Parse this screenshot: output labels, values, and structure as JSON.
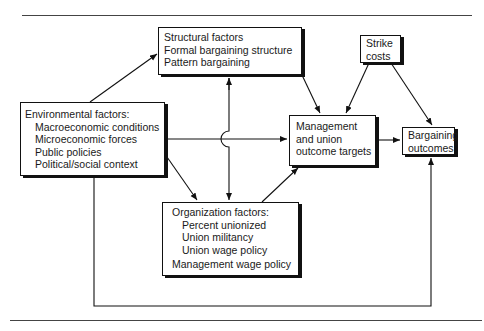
{
  "diagram": {
    "nodes": {
      "structural": {
        "lines": [
          "Structural factors",
          "Formal bargaining structure",
          "Pattern bargaining"
        ]
      },
      "strike": {
        "lines": [
          "Strike",
          "costs"
        ]
      },
      "environmental": {
        "title": "Environmental factors:",
        "items": [
          "Macroeconomic conditions",
          "Microeconomic forces",
          "Public policies",
          "Political/social context"
        ]
      },
      "targets": {
        "lines": [
          "Management",
          "and union",
          "outcome targets"
        ]
      },
      "outcomes": {
        "lines": [
          "Bargaining",
          "outcomes"
        ]
      },
      "organization": {
        "title": "Organization factors:",
        "items": [
          "Percent unionized",
          "Union militancy",
          "Union wage policy"
        ],
        "footer": "Management wage policy"
      }
    },
    "edges": [
      {
        "from": "environmental",
        "to": "structural"
      },
      {
        "from": "environmental",
        "to": "targets"
      },
      {
        "from": "environmental",
        "to": "organization"
      },
      {
        "from": "environmental",
        "to": "outcomes",
        "route": "bottom-loop"
      },
      {
        "from": "structural",
        "to": "organization",
        "bidirectional": true
      },
      {
        "from": "structural",
        "to": "targets"
      },
      {
        "from": "organization",
        "to": "targets"
      },
      {
        "from": "strike",
        "to": "targets"
      },
      {
        "from": "strike",
        "to": "outcomes"
      },
      {
        "from": "targets",
        "to": "outcomes"
      }
    ],
    "colors": {
      "line": "#111111",
      "background": "#ffffff"
    }
  }
}
